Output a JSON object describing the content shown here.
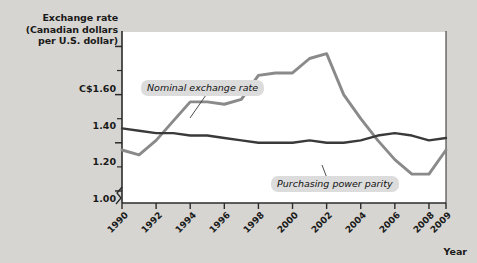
{
  "figure": {
    "background_color": "#d7d5d1",
    "plot_background_color": "#ffffff"
  },
  "yaxis": {
    "title_line1": "Exchange rate",
    "title_line2": "(Canadian dollars",
    "title_line3": "per U.S. dollar)",
    "tick_labels": [
      "C$1.60",
      "1.40",
      "1.20",
      "1.00"
    ]
  },
  "xaxis": {
    "title": "Year",
    "tick_labels": [
      "1990",
      "1992",
      "1994",
      "1996",
      "1998",
      "2000",
      "2002",
      "2004",
      "2006",
      "2008",
      "2009"
    ]
  },
  "annotations": {
    "nominal_label": "Nominal exchange rate",
    "ppp_label": "Purchasing power parity"
  },
  "colors": {
    "nominal_line": "#8a8a8a",
    "ppp_line": "#3a3a3a",
    "axis": "#2b2b2b",
    "callout_background": "#dcdcdc",
    "page_background": "#d7d5d1"
  },
  "chart_data": {
    "type": "line",
    "title": "",
    "xlabel": "Year",
    "ylabel": "Exchange rate (Canadian dollars per U.S. dollar)",
    "xlim": [
      1990,
      2009
    ],
    "ylim": [
      0.95,
      1.66
    ],
    "grid": false,
    "legend": "inline-callouts",
    "x": [
      1990,
      1991,
      1992,
      1993,
      1994,
      1995,
      1996,
      1997,
      1998,
      1999,
      2000,
      2001,
      2002,
      2003,
      2004,
      2005,
      2006,
      2007,
      2008,
      2009
    ],
    "series": [
      {
        "name": "Nominal exchange rate",
        "color": "#8a8a8a",
        "values": [
          1.17,
          1.15,
          1.21,
          1.29,
          1.37,
          1.37,
          1.36,
          1.38,
          1.48,
          1.49,
          1.49,
          1.55,
          1.57,
          1.4,
          1.3,
          1.21,
          1.13,
          1.07,
          1.07,
          1.17
        ]
      },
      {
        "name": "Purchasing power parity",
        "color": "#3a3a3a",
        "values": [
          1.26,
          1.25,
          1.24,
          1.24,
          1.23,
          1.23,
          1.22,
          1.21,
          1.2,
          1.2,
          1.2,
          1.21,
          1.2,
          1.2,
          1.21,
          1.23,
          1.24,
          1.23,
          1.21,
          1.22
        ]
      }
    ]
  }
}
